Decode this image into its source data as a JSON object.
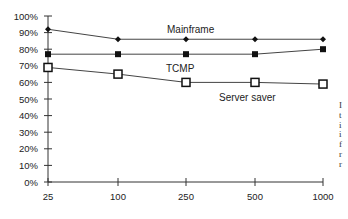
{
  "chart_data": {
    "type": "line",
    "title": "",
    "xlabel": "",
    "ylabel": "",
    "categories": [
      "25",
      "100",
      "250",
      "500",
      "1000"
    ],
    "ylim": [
      0,
      100
    ],
    "yticks": [
      "0%",
      "10%",
      "20%",
      "30%",
      "40%",
      "50%",
      "60%",
      "70%",
      "80%",
      "90%",
      "100%"
    ],
    "grid": false,
    "legend": "inline labels",
    "series": [
      {
        "name": "Mainframe",
        "marker": "diamond",
        "values": [
          92,
          86,
          86,
          86,
          86
        ]
      },
      {
        "name": "TCMP",
        "marker": "filled-square",
        "values": [
          77,
          77,
          77,
          77,
          80
        ]
      },
      {
        "name": "Server saver",
        "marker": "open-square",
        "values": [
          69,
          65,
          60,
          60,
          59
        ]
      }
    ],
    "annotations": [
      {
        "text": "Mainframe",
        "near": "100-250",
        "value": 86
      },
      {
        "text": "TCMP",
        "near": "100-250",
        "value": 70
      },
      {
        "text": "Server saver",
        "near": "250-500",
        "value": 55
      }
    ]
  },
  "right_edge_marks": [
    "I",
    "t",
    "i",
    "i",
    "f",
    "r",
    "r"
  ]
}
